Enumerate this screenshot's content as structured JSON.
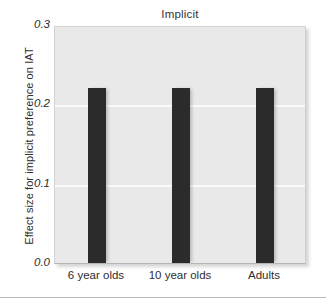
{
  "chart_data": {
    "type": "bar",
    "title": "Implicit",
    "xlabel": "",
    "ylabel": "Effect size for implicit preference on IAT",
    "categories": [
      "6 year olds",
      "10 year olds",
      "Adults"
    ],
    "values": [
      0.22,
      0.22,
      0.22
    ],
    "ylim": [
      0.0,
      0.3
    ],
    "yticks": [
      0.0,
      0.1,
      0.2,
      0.3
    ],
    "ytick_labels": [
      "0.0",
      "0.1",
      "0.2",
      "0.3"
    ],
    "grid": true,
    "gridlines_at": [
      0.1,
      0.2
    ],
    "legend": null,
    "legend_position": "none",
    "colors": {
      "bar": "#2b2b2b",
      "plot_background": "#e9e9e9",
      "gridline": "#fafafa",
      "figure_background": "#ffffff",
      "text": "#2e2e2e"
    }
  },
  "figure": {
    "title": "Implicit",
    "y_axis_title": "Effect size for implicit preference on IAT"
  }
}
